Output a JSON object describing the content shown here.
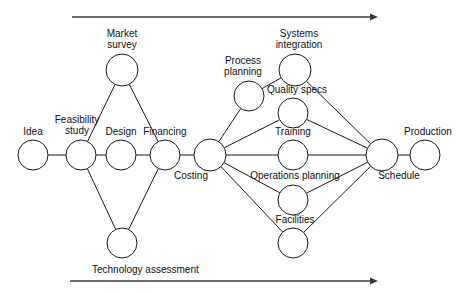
{
  "diagram": {
    "type": "network-diagram",
    "canvas": {
      "width": 467,
      "height": 292
    },
    "nodes": [
      {
        "id": "idea",
        "label": "Idea",
        "cx": 33,
        "cy": 155,
        "r": 15,
        "label_x": 33,
        "label_y": 126,
        "align": "center"
      },
      {
        "id": "feasibility-study",
        "label": "Feasibility\nstudy",
        "cx": 81,
        "cy": 155,
        "r": 15,
        "label_x": 77,
        "label_y": 114,
        "align": "center"
      },
      {
        "id": "market-survey",
        "label": "Market\nsurvey",
        "cx": 122,
        "cy": 70,
        "r": 16,
        "label_x": 122,
        "label_y": 28,
        "align": "center"
      },
      {
        "id": "design",
        "label": "Design",
        "cx": 121,
        "cy": 155,
        "r": 15,
        "label_x": 121,
        "label_y": 126,
        "align": "center"
      },
      {
        "id": "technology-node",
        "label": "",
        "cx": 122,
        "cy": 243,
        "r": 15,
        "label_x": 122,
        "label_y": 243,
        "align": "center"
      },
      {
        "id": "financing",
        "label": "Financing",
        "cx": 165,
        "cy": 155,
        "r": 15,
        "label_x": 165,
        "label_y": 126,
        "align": "center"
      },
      {
        "id": "costing",
        "label": "Costing",
        "cx": 210,
        "cy": 155,
        "r": 16,
        "label_x": 191,
        "label_y": 170,
        "align": "center"
      },
      {
        "id": "process-planning",
        "label": "Process\nplanning",
        "cx": 249,
        "cy": 96,
        "r": 15,
        "label_x": 243,
        "label_y": 55,
        "align": "center"
      },
      {
        "id": "systems-integration",
        "label": "Systems\nintegration",
        "cx": 295,
        "cy": 70,
        "r": 16,
        "label_x": 299,
        "label_y": 28,
        "align": "center"
      },
      {
        "id": "quality-specs",
        "label": "Quality specs",
        "cx": 293,
        "cy": 113,
        "r": 15,
        "label_x": 297,
        "label_y": 84,
        "align": "center"
      },
      {
        "id": "training",
        "label": "Training",
        "cx": 293,
        "cy": 155,
        "r": 15,
        "label_x": 293,
        "label_y": 126,
        "align": "center"
      },
      {
        "id": "operations-planning",
        "label": "Operations planning",
        "cx": 293,
        "cy": 200,
        "r": 15,
        "label_x": 295,
        "label_y": 170,
        "align": "center"
      },
      {
        "id": "facilities",
        "label": "Facilities",
        "cx": 293,
        "cy": 243,
        "r": 15,
        "label_x": 295,
        "label_y": 214,
        "align": "center"
      },
      {
        "id": "schedule",
        "label": "Schedule",
        "cx": 382,
        "cy": 155,
        "r": 16,
        "label_x": 399,
        "label_y": 170,
        "align": "center"
      },
      {
        "id": "production",
        "label": "Production",
        "cx": 425,
        "cy": 155,
        "r": 15,
        "label_x": 428,
        "label_y": 126,
        "align": "center"
      }
    ],
    "edges": [
      {
        "from": "idea",
        "to": "feasibility-study"
      },
      {
        "from": "feasibility-study",
        "to": "market-survey"
      },
      {
        "from": "feasibility-study",
        "to": "design"
      },
      {
        "from": "feasibility-study",
        "to": "technology-node"
      },
      {
        "from": "design",
        "to": "financing"
      },
      {
        "from": "market-survey",
        "to": "financing"
      },
      {
        "from": "technology-node",
        "to": "financing"
      },
      {
        "from": "financing",
        "to": "costing"
      },
      {
        "from": "costing",
        "to": "process-planning"
      },
      {
        "from": "costing",
        "to": "quality-specs"
      },
      {
        "from": "costing",
        "to": "training"
      },
      {
        "from": "costing",
        "to": "operations-planning"
      },
      {
        "from": "costing",
        "to": "facilities"
      },
      {
        "from": "process-planning",
        "to": "systems-integration"
      },
      {
        "from": "systems-integration",
        "to": "schedule"
      },
      {
        "from": "quality-specs",
        "to": "schedule"
      },
      {
        "from": "training",
        "to": "schedule"
      },
      {
        "from": "operations-planning",
        "to": "schedule"
      },
      {
        "from": "facilities",
        "to": "schedule"
      },
      {
        "from": "schedule",
        "to": "production"
      }
    ],
    "axes": [
      {
        "id": "top-arrow",
        "x1": 72,
        "y1": 17,
        "x2": 378,
        "y2": 17,
        "label": "",
        "label_x": 0,
        "label_y": 0
      },
      {
        "id": "bottom-arrow",
        "x1": 70,
        "y1": 281,
        "x2": 378,
        "y2": 281,
        "label": "Technology assessment",
        "label_x": 92,
        "label_y": 264
      }
    ],
    "colors": {
      "node_stroke": "#1a1a1a",
      "node_fill": "#ffffff",
      "edge": "#1a1a1a",
      "axis": "#3a3a3a",
      "text": "#111111",
      "background": "#ffffff"
    }
  }
}
